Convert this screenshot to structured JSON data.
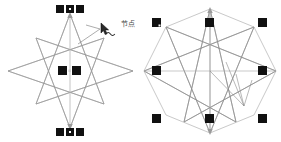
{
  "canvas": {
    "width": 281,
    "height": 142,
    "background": "#ffffff"
  },
  "style": {
    "stroke_color": "#9a9a9a",
    "stroke_color_dark": "#7d7d7d",
    "handle_fill": "#000000",
    "handle_center": "#ffffff",
    "annotation_color": "#4a4a4a"
  },
  "figures": [
    {
      "id": "left-figure",
      "name": "node-edit-star",
      "description_label": "node-edit mode star",
      "shape_type": "8-point-star-polygon",
      "skewed": true,
      "handles": {
        "type": "node-handles",
        "top_group_count": 3,
        "bottom_group_count": 3,
        "center_group_count": 2
      },
      "annotation": {
        "text": "节点",
        "icon": "node-edit-cursor-icon"
      }
    },
    {
      "id": "right-figure",
      "name": "selection-star",
      "description_label": "selected star with bounding handles",
      "shape_type": "8-point-star-polygon",
      "skewed": false,
      "handles": {
        "type": "selection-handles",
        "count": 8,
        "positions": [
          "top-left",
          "top-center",
          "top-right",
          "middle-left",
          "middle-right",
          "bottom-left",
          "bottom-center",
          "bottom-right"
        ]
      },
      "annotation": {
        "text": "干",
        "icon": "selection-cursor-icon"
      }
    }
  ]
}
